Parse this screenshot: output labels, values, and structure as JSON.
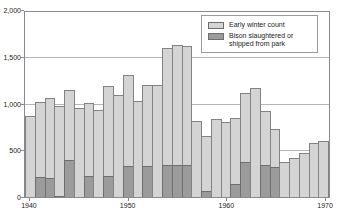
{
  "chart_data": {
    "type": "bar",
    "stacked": true,
    "xlabel": "",
    "ylabel": "",
    "ylim": [
      0,
      2000
    ],
    "grid": true,
    "legend_position": "top-right",
    "years": [
      1940,
      1941,
      1942,
      1943,
      1944,
      1945,
      1946,
      1947,
      1948,
      1949,
      1950,
      1951,
      1952,
      1953,
      1954,
      1955,
      1956,
      1957,
      1958,
      1959,
      1960,
      1961,
      1962,
      1963,
      1964,
      1965,
      1966,
      1967,
      1968,
      1969,
      1970
    ],
    "series": [
      {
        "name": "Early winter count",
        "color": "#d4d4d4",
        "values": [
          870,
          1020,
          1060,
          975,
          1140,
          950,
          1010,
          930,
          1185,
          1095,
          1310,
          1030,
          1200,
          1200,
          1590,
          1630,
          1610,
          810,
          650,
          830,
          800,
          850,
          1110,
          1165,
          920,
          730,
          370,
          420,
          475,
          575,
          600
        ]
      },
      {
        "name": "Bison slaughtered or shipped from park",
        "color": "#9b9b9b",
        "values": [
          0,
          210,
          200,
          15,
          400,
          0,
          230,
          0,
          225,
          0,
          330,
          0,
          330,
          0,
          340,
          340,
          340,
          0,
          60,
          0,
          0,
          140,
          370,
          0,
          345,
          325,
          0,
          0,
          0,
          0,
          0
        ]
      }
    ],
    "yticks": [
      {
        "value": 0,
        "label": "0"
      },
      {
        "value": 500,
        "label": "500"
      },
      {
        "value": 1000,
        "label": "1,000"
      },
      {
        "value": 1500,
        "label": "1,500"
      },
      {
        "value": 2000,
        "label": "2,000"
      }
    ],
    "xticks": [
      {
        "year": 1940,
        "label": "1940"
      },
      {
        "year": 1950,
        "label": "1950"
      },
      {
        "year": 1960,
        "label": "1960"
      },
      {
        "year": 1970,
        "label": "1970"
      }
    ]
  },
  "legend": {
    "items": [
      {
        "label": "Early winter count",
        "swatch": "#d4d4d4"
      },
      {
        "label": "Bison slaughtered or shipped from park",
        "swatch": "#9b9b9b"
      }
    ]
  },
  "colors": {
    "bar_light": "#d4d4d4",
    "bar_dark": "#9b9b9b",
    "bar_border": "#828282",
    "gridline": "#b4b4b4",
    "axis": "#8a8a8a",
    "text": "#222222",
    "background": "#ffffff"
  }
}
